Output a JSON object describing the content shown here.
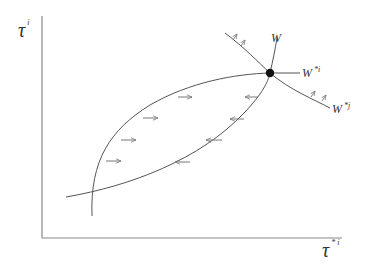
{
  "diagram": {
    "type": "reaction-function-diagram",
    "axes": {
      "y_label": {
        "symbol": "τ",
        "superscript": "i"
      },
      "x_label": {
        "symbol": "τ",
        "superscript": "* i"
      }
    },
    "curves": [
      {
        "name": "W",
        "label": "W",
        "superscript": ""
      },
      {
        "name": "W*i",
        "label": "W",
        "superscript": "*i"
      },
      {
        "name": "W*j",
        "label": "W",
        "superscript": "*j"
      }
    ],
    "equilibrium_point": {
      "marker": "filled-circle"
    },
    "arrows": {
      "right_pointing_count": 4,
      "left_pointing_count": 4,
      "small_up_arrows_on_W_star_j": 4
    },
    "colors": {
      "line": "#555555",
      "arrow": "#777777",
      "point": "#111111",
      "text": "#333333"
    }
  }
}
